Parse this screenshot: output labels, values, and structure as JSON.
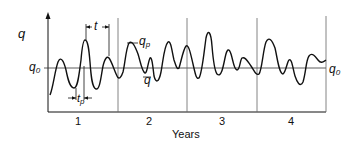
{
  "diagram": {
    "y_axis_label": "q",
    "baseline_label_left": {
      "main": "q",
      "sub": "0"
    },
    "baseline_label_right": {
      "main": "q",
      "sub": "0"
    },
    "peak_label": {
      "main": "q",
      "sub": "p"
    },
    "trough_label": "q",
    "interval_label": "t",
    "duration_label": {
      "main": "t",
      "sub": "p"
    },
    "x_axis_label": "Years",
    "year_labels": [
      "1",
      "2",
      "3",
      "4"
    ],
    "colors": {
      "line": "#111111",
      "grid": "#555555",
      "background": "#ffffff"
    }
  }
}
